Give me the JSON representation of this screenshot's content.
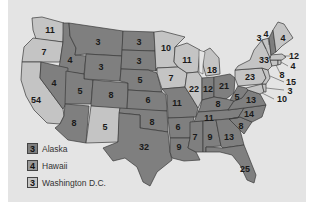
{
  "map": {
    "title": "",
    "colors": {
      "dark": "#7f7f7f",
      "medium": "#999999",
      "light": "#c4c4c4",
      "background": "#e4e4e4"
    },
    "states": [
      {
        "id": "WA",
        "votes": "11",
        "shade": "light",
        "x": 50,
        "y": 30
      },
      {
        "id": "OR",
        "votes": "7",
        "shade": "light",
        "x": 44,
        "y": 52
      },
      {
        "id": "CA",
        "votes": "54",
        "shade": "light",
        "x": 36,
        "y": 100
      },
      {
        "id": "ID",
        "votes": "4",
        "shade": "dark",
        "x": 70,
        "y": 60
      },
      {
        "id": "NV",
        "votes": "4",
        "shade": "dark",
        "x": 54,
        "y": 83
      },
      {
        "id": "MT",
        "votes": "3",
        "shade": "dark",
        "x": 98,
        "y": 42
      },
      {
        "id": "WY",
        "votes": "3",
        "shade": "dark",
        "x": 101,
        "y": 67
      },
      {
        "id": "UT",
        "votes": "5",
        "shade": "dark",
        "x": 80,
        "y": 91
      },
      {
        "id": "AZ",
        "votes": "8",
        "shade": "dark",
        "x": 74,
        "y": 123
      },
      {
        "id": "CO",
        "votes": "8",
        "shade": "dark",
        "x": 111,
        "y": 95
      },
      {
        "id": "NM",
        "votes": "5",
        "shade": "light",
        "x": 105,
        "y": 127
      },
      {
        "id": "ND",
        "votes": "3",
        "shade": "dark",
        "x": 139,
        "y": 42
      },
      {
        "id": "SD",
        "votes": "3",
        "shade": "dark",
        "x": 139,
        "y": 61
      },
      {
        "id": "NE",
        "votes": "5",
        "shade": "dark",
        "x": 140,
        "y": 80
      },
      {
        "id": "KS",
        "votes": "6",
        "shade": "dark",
        "x": 148,
        "y": 100
      },
      {
        "id": "OK",
        "votes": "8",
        "shade": "dark",
        "x": 152,
        "y": 122
      },
      {
        "id": "TX",
        "votes": "32",
        "shade": "dark",
        "x": 144,
        "y": 147
      },
      {
        "id": "MN",
        "votes": "10",
        "shade": "light",
        "x": 166,
        "y": 48
      },
      {
        "id": "IA",
        "votes": "7",
        "shade": "light",
        "x": 171,
        "y": 78
      },
      {
        "id": "MO",
        "votes": "11",
        "shade": "dark",
        "x": 177,
        "y": 103
      },
      {
        "id": "AR",
        "votes": "6",
        "shade": "dark",
        "x": 178,
        "y": 127
      },
      {
        "id": "LA",
        "votes": "9",
        "shade": "dark",
        "x": 179,
        "y": 147
      },
      {
        "id": "WI",
        "votes": "11",
        "shade": "light",
        "x": 187,
        "y": 60
      },
      {
        "id": "IL",
        "votes": "22",
        "shade": "light",
        "x": 194,
        "y": 89
      },
      {
        "id": "MI",
        "votes": "18",
        "shade": "light",
        "x": 212,
        "y": 70
      },
      {
        "id": "IN",
        "votes": "12",
        "shade": "dark",
        "x": 208,
        "y": 89
      },
      {
        "id": "OH",
        "votes": "21",
        "shade": "dark",
        "x": 224,
        "y": 86
      },
      {
        "id": "KY",
        "votes": "8",
        "shade": "dark",
        "x": 218,
        "y": 104
      },
      {
        "id": "TN",
        "votes": "11",
        "shade": "dark",
        "x": 209,
        "y": 118
      },
      {
        "id": "MS",
        "votes": "7",
        "shade": "dark",
        "x": 195,
        "y": 137
      },
      {
        "id": "AL",
        "votes": "9",
        "shade": "dark",
        "x": 210,
        "y": 137
      },
      {
        "id": "GA",
        "votes": "13",
        "shade": "dark",
        "x": 229,
        "y": 137
      },
      {
        "id": "FL",
        "votes": "25",
        "shade": "dark",
        "x": 245,
        "y": 169
      },
      {
        "id": "SC",
        "votes": "8",
        "shade": "dark",
        "x": 241,
        "y": 126
      },
      {
        "id": "NC",
        "votes": "14",
        "shade": "dark",
        "x": 249,
        "y": 114
      },
      {
        "id": "VA",
        "votes": "13",
        "shade": "dark",
        "x": 251,
        "y": 100
      },
      {
        "id": "WV",
        "votes": "5",
        "shade": "dark",
        "x": 237,
        "y": 97
      },
      {
        "id": "PA",
        "votes": "23",
        "shade": "light",
        "x": 250,
        "y": 77
      },
      {
        "id": "NY",
        "votes": "33",
        "shade": "light",
        "x": 264,
        "y": 60
      },
      {
        "id": "ME",
        "votes": "4",
        "shade": "light",
        "x": 283,
        "y": 38
      },
      {
        "id": "VT",
        "votes": "3",
        "shade": "light",
        "x": 259,
        "y": 38
      },
      {
        "id": "NH",
        "votes": "4",
        "shade": "dark",
        "x": 266,
        "y": 34
      },
      {
        "id": "MA",
        "votes": "12",
        "shade": "light",
        "x": 294,
        "y": 56
      },
      {
        "id": "RI",
        "votes": "4",
        "shade": "light",
        "x": 293,
        "y": 66
      },
      {
        "id": "CT",
        "votes": "8",
        "shade": "light",
        "x": 282,
        "y": 75
      },
      {
        "id": "NJ",
        "votes": "15",
        "shade": "light",
        "x": 291,
        "y": 82
      },
      {
        "id": "DE",
        "votes": "3",
        "shade": "light",
        "x": 290,
        "y": 91
      },
      {
        "id": "MD",
        "votes": "10",
        "shade": "light",
        "x": 282,
        "y": 99
      }
    ]
  },
  "legend": [
    {
      "votes": "3",
      "label": "Alaska",
      "shade": "dark"
    },
    {
      "votes": "4",
      "label": "Hawaii",
      "shade": "medium"
    },
    {
      "votes": "3",
      "label": "Washington D.C.",
      "shade": "light"
    }
  ]
}
